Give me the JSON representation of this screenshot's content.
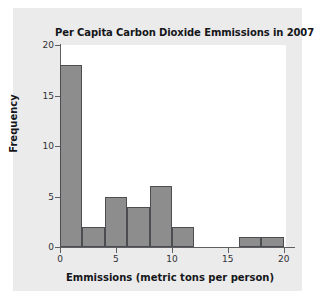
{
  "chart_data": {
    "type": "bar",
    "title": "Per Capita Carbon Dioxide Emmissions in 2007",
    "xlabel": "Emmissions (metric tons per person)",
    "ylabel": "Frequency",
    "categories": [
      "0-2",
      "2-4",
      "4-6",
      "6-8",
      "8-10",
      "10-12",
      "12-14",
      "14-16",
      "16-18",
      "18-20"
    ],
    "bin_edges": [
      0,
      2,
      4,
      6,
      8,
      10,
      12,
      14,
      16,
      18,
      20
    ],
    "bin_width": 2,
    "values": [
      18,
      2,
      5,
      4,
      6,
      2,
      0,
      0,
      1,
      1
    ],
    "xlim": [
      0,
      21
    ],
    "ylim": [
      0,
      20
    ],
    "xticks": [
      0,
      5,
      10,
      15,
      20
    ],
    "yticks": [
      0,
      5,
      10,
      15,
      20
    ],
    "grid": false,
    "legend": null,
    "bar_color": "#8d8d8d",
    "bar_edge_color": "#4c4d51",
    "plot_background": "#ffffff",
    "figure_background": "#ebebeb",
    "axis_color": "#5d5f63",
    "text_color": "#15161a"
  }
}
